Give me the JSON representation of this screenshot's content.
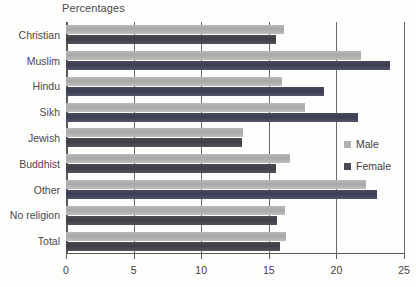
{
  "chart_data": {
    "type": "bar",
    "orientation": "horizontal",
    "title": "Percentages",
    "xlabel": "",
    "ylabel": "",
    "xlim": [
      0,
      25
    ],
    "xticks": [
      0,
      5,
      10,
      15,
      20,
      25
    ],
    "xtick_labels": [
      "0",
      "5",
      "10",
      "15",
      "20",
      "25"
    ],
    "grid": true,
    "grid_axis": "x",
    "legend_position": "right",
    "categories": [
      "Christian",
      "Muslim",
      "Hindu",
      "Sikh",
      "Jewish",
      "Buddhist",
      "Other",
      "No religion",
      "Total"
    ],
    "series": [
      {
        "name": "Male",
        "color": "#b0b0b0",
        "values": [
          16.1,
          21.8,
          16.0,
          17.7,
          13.1,
          16.6,
          22.2,
          16.2,
          16.3
        ]
      },
      {
        "name": "Female",
        "color": "#4a4a56",
        "values": [
          15.5,
          24.0,
          19.1,
          21.6,
          13.0,
          15.5,
          23.0,
          15.6,
          15.8
        ]
      }
    ]
  },
  "legend": {
    "items": [
      {
        "label": "Male"
      },
      {
        "label": "Female"
      }
    ]
  },
  "colors": {
    "male": "#b0b0b0",
    "female": "#4a4a56",
    "axis": "#5a5a5a",
    "grid": "#6b6b6b",
    "text": "#3d3d3d",
    "background": "#fdfdfc"
  }
}
